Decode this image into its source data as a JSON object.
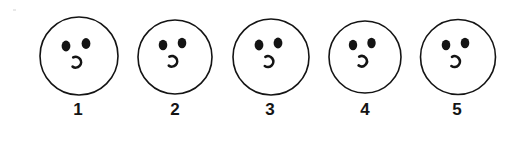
{
  "figure": {
    "type": "illustration",
    "background_color": "#ffffff",
    "ink_color": "#141414",
    "face_fill_color": "#ffffff"
  },
  "faces": [
    {
      "label": "1",
      "name": "face-1",
      "expression": "neutral-open-mouth",
      "left_eye": "oval",
      "right_eye": "oval",
      "mouth": "small-open-arc"
    },
    {
      "label": "2",
      "name": "face-2",
      "expression": "neutral-open-mouth",
      "left_eye": "oval",
      "right_eye": "oval",
      "mouth": "small-open-arc"
    },
    {
      "label": "3",
      "name": "face-3",
      "expression": "neutral-open-mouth",
      "left_eye": "oval",
      "right_eye": "oval",
      "mouth": "small-open-arc"
    },
    {
      "label": "4",
      "name": "face-4",
      "expression": "neutral-open-mouth",
      "left_eye": "oval",
      "right_eye": "oval",
      "mouth": "small-open-arc"
    },
    {
      "label": "5",
      "name": "face-5",
      "expression": "neutral-open-mouth",
      "left_eye": "oval",
      "right_eye": "oval",
      "mouth": "small-open-arc"
    }
  ]
}
